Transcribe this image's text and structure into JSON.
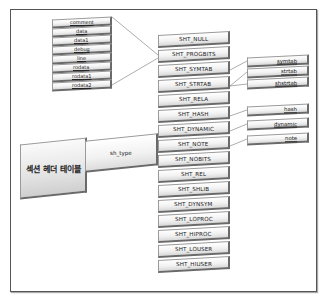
{
  "diagram": {
    "section_header_table": "섹션 헤더 테이블",
    "field": "sh_type",
    "sh_types": [
      "SHT_NULL",
      "SHT_PROGBITS",
      "SHT_SYMTAB",
      "SHT_STRTAB",
      "SHT_RELA",
      "SHT_HASH",
      "SHT_DYNAMIC",
      "SHT_NOTE",
      "SHT_NOBITS",
      "SHT_REL",
      "SHT_SHLIB",
      "SHT_DYNSYM",
      "SHT_LOPROC",
      "SHT_HIPROC",
      "SHT_LOUSER",
      "SHT_HIUSER"
    ],
    "progbits_sections": [
      "comment",
      "data",
      "data1",
      "debug",
      "line",
      "rodata",
      "rodata1",
      "rodata2"
    ],
    "symtab_strtab_sections": [
      "symtab",
      "strtab",
      "shstrtab"
    ],
    "other_sections": [
      "hash",
      "dynamic",
      "note"
    ],
    "colors": {
      "line": "#8a8a8a",
      "border": "#555555"
    }
  }
}
